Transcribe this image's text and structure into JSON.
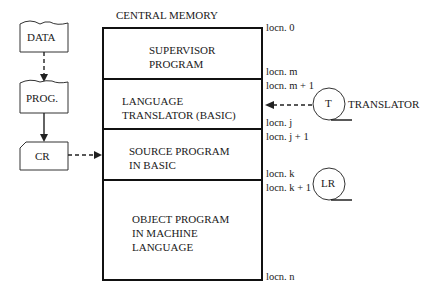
{
  "memory": {
    "title": "CENTRAL MEMORY",
    "segments": [
      {
        "lines": [
          "SUPERVISOR",
          "PROGRAM"
        ]
      },
      {
        "lines": [
          "LANGUAGE",
          "TRANSLATOR (BASIC)"
        ]
      },
      {
        "lines": [
          "SOURCE PROGRAM",
          "IN BASIC"
        ]
      },
      {
        "lines": [
          "OBJECT PROGRAM",
          "IN MACHINE",
          "LANGUAGE"
        ]
      }
    ],
    "locations": [
      "locn. 0",
      "locn. m",
      "locn. m + 1",
      "locn. j",
      "locn. j + 1",
      "locn. k",
      "locn. k + 1",
      "locn. n"
    ]
  },
  "input_flow": {
    "data_card": "DATA",
    "prog_card": "PROG.",
    "card_reader": "CR"
  },
  "devices": {
    "translator_reel": "T",
    "translator_label": "TRANSLATOR",
    "lr_reel": "LR"
  }
}
